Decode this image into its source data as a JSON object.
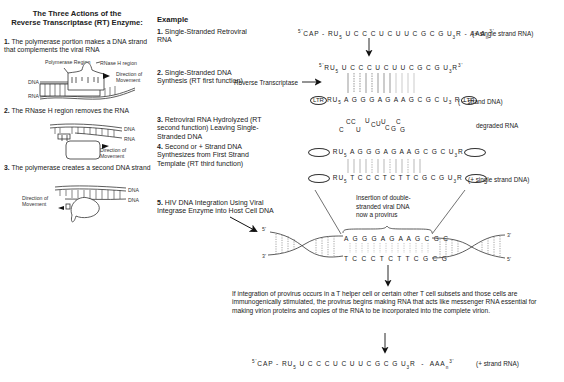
{
  "left_panel": {
    "title_line1": "The Three Actions of the",
    "title_line2": "Reverse Transcriptase (RT) Enzyme:",
    "steps": [
      {
        "num": "1.",
        "text": "The polymerase portion makes a DNA strand that complements the viral RNA"
      },
      {
        "num": "2.",
        "text": "The RNase H region removes the RNA"
      },
      {
        "num": "3.",
        "text": "The polymerase creates a second DNA strand"
      }
    ],
    "fig1_labels": {
      "polymerase": "Polymerase Region",
      "rnase": "RNase H region",
      "direction": "Direction of Movement",
      "dna": "DNA",
      "rna": "RNA"
    },
    "fig2_labels": {
      "dna": "DNA",
      "rna": "RNA",
      "direction": "Direction of Movement"
    },
    "fig3_labels": {
      "dna_top": "DNA",
      "dna_bottom": "DNA",
      "direction": "Direction of Movement"
    }
  },
  "example": {
    "heading": "Example",
    "items": [
      {
        "num": "1.",
        "text": "Single-Stranded Retroviral RNA"
      },
      {
        "num": "2.",
        "text": "Single-Stranded DNA Synthesis (RT first function)"
      },
      {
        "num": "3.",
        "text": "Retroviral RNA Hydrolyzed (RT second function) Leaving Single-Stranded DNA"
      },
      {
        "num": "4.",
        "text": "Second or + Strand DNA Synthesizes from First Strand Template (RT third function)"
      },
      {
        "num": "5.",
        "text": "HIV DNA Integration Using Viral Integrase Enzyme into Host Cell DNA"
      }
    ]
  },
  "sequences": {
    "s1_prefix": "CAP - RU",
    "s1_mid": " U C C C U C U U C G C G U",
    "s1_suffix": "R - AAA",
    "s1_note": "(+ single strand RNA)",
    "rt_label": "Reverse Transcriptase",
    "s2_top": " U C C C U C U U C G C G U",
    "s2_bottom": " A G G G A G A A G C G C U",
    "ltr": "LTR",
    "s2_note": "( − strand DNA)",
    "degraded_note": "degraded RNA",
    "degraded_letters": [
      "C",
      "C",
      "U",
      "C",
      "U",
      "U",
      "C",
      "U",
      "C",
      "G",
      "G",
      "C"
    ],
    "s4_top": " A G G G A G A A G C G C U",
    "s4_bottom": " T C C C T C T T C G C G U",
    "s4_note": "(+ single strand DNA)",
    "insertion_note": [
      "Insertion of double-",
      "stranded viral DNA",
      "now a provirus"
    ],
    "provirus_top": "A G G G A G A A G C G C",
    "provirus_bottom": "T C C C T C T T C G C G",
    "final_note": "(+ strand RNA)",
    "five_prime": "5'",
    "three_prime": "3'"
  },
  "paragraph": "If integration of provirus occurs in a T helper cell or certain other T cell subsets and those cells are immunogenically stimulated, the provirus begins making RNA that acts like messenger RNA essential for making virion proteins and copies of the RNA to be incorporated into the complete virion."
}
